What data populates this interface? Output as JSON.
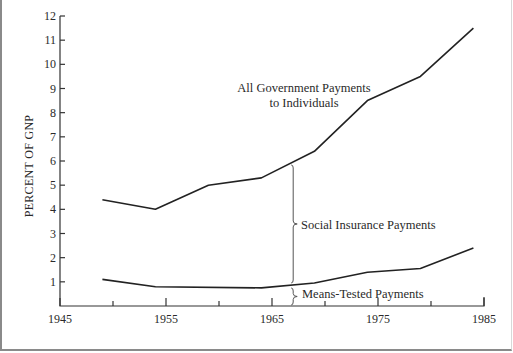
{
  "chart_data": {
    "type": "line",
    "title": "",
    "xlabel": "",
    "ylabel": "PERCENT OF GNP",
    "xlim": [
      1945,
      1985
    ],
    "ylim": [
      0,
      12
    ],
    "grid": false,
    "x_tick_labels": [
      "1945",
      "1955",
      "1965",
      "1975",
      "1985"
    ],
    "x_ticks": [
      1945,
      1950,
      1955,
      1960,
      1965,
      1970,
      1975,
      1980,
      1985
    ],
    "y_tick_labels": [
      "1",
      "2",
      "3",
      "4",
      "5",
      "6",
      "7",
      "8",
      "9",
      "10",
      "11",
      "12"
    ],
    "series": [
      {
        "name": "All Government Payments to Individuals",
        "x": [
          1949,
          1954,
          1959,
          1964,
          1969,
          1974,
          1979,
          1984
        ],
        "values": [
          4.4,
          4.0,
          5.0,
          5.3,
          6.4,
          8.5,
          9.5,
          11.5
        ]
      },
      {
        "name": "Means-Tested Payments",
        "x": [
          1949,
          1954,
          1964,
          1969,
          1974,
          1979,
          1984
        ],
        "values": [
          1.1,
          0.8,
          0.75,
          0.95,
          1.4,
          1.55,
          2.4
        ]
      }
    ],
    "annotations": [
      {
        "text_line1": "All Government Payments",
        "text_line2": "to Individuals",
        "target": "upper line"
      },
      {
        "text": "Social Insurance Payments",
        "type": "brace",
        "x": 1967,
        "from": "means-tested line",
        "to": "total line"
      },
      {
        "text": "Means-Tested Payments",
        "type": "brace",
        "x": 1967,
        "from": 0,
        "to": "means-tested line"
      }
    ]
  },
  "labels": {
    "ylabel": "PERCENT OF GNP",
    "total_line1": "All Government Payments",
    "total_line2": "to Individuals",
    "social": "Social Insurance Payments",
    "means": "Means-Tested Payments"
  },
  "colors": {
    "line": "#222222",
    "axis": "#333333",
    "text": "#2a2a2a",
    "background": "#ffffff"
  }
}
